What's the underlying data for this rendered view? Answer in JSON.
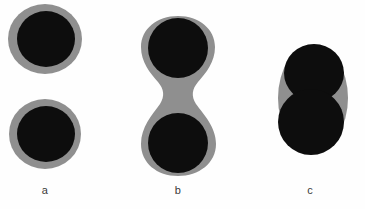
{
  "figure": {
    "name": "particle-coalescence-stages",
    "width": 365,
    "height": 209,
    "background_color": "#fefefe",
    "colors": {
      "core": "#0d0d0d",
      "shell": "#8f8f8f",
      "label_text": "#3a3a3a",
      "background": "#fefefe"
    }
  },
  "panels": [
    {
      "id": "a",
      "label": "a",
      "label_x": 45,
      "label_y": 190,
      "description": "two separate core-shell particles",
      "shells": [
        {
          "name": "shell-top",
          "cx": 45,
          "cy": 39,
          "rx": 37,
          "ry": 35
        },
        {
          "name": "shell-bottom",
          "cx": 45,
          "cy": 134,
          "rx": 36,
          "ry": 35
        }
      ],
      "cores": [
        {
          "name": "core-top",
          "cx": 46,
          "cy": 39,
          "rx": 29,
          "ry": 28
        },
        {
          "name": "core-bottom",
          "cx": 46,
          "cy": 134,
          "rx": 29,
          "ry": 28
        }
      ]
    },
    {
      "id": "b",
      "label": "b",
      "label_x": 178,
      "label_y": 190,
      "description": "two cores joined by a narrow shell bridge forming a dumbbell",
      "shell_path": "M 178 16 C 199 16 215 29 215 47 C 215 62 206 73 198 82 C 192 89 191 96 196 104 C 204 115 216 127 216 144 C 216 163 199 176 178 176 C 157 176 141 163 141 144 C 141 127 152 115 160 104 C 165 96 164 89 158 82 C 150 73 141 62 141 47 C 141 29 157 16 178 16 Z",
      "cores": [
        {
          "name": "core-top",
          "cx": 178,
          "cy": 48,
          "rx": 30,
          "ry": 30
        },
        {
          "name": "core-bottom",
          "cx": 178,
          "cy": 143,
          "rx": 30,
          "ry": 30
        }
      ]
    },
    {
      "id": "c",
      "label": "c",
      "label_x": 310,
      "label_y": 190,
      "description": "two cores in contact enclosed in a single shell envelope",
      "shells": [
        {
          "name": "shell-envelope",
          "cx": 313,
          "cy": 98,
          "rx": 35,
          "ry": 53
        }
      ],
      "cores": [
        {
          "name": "core-top",
          "cx": 314,
          "cy": 73,
          "rx": 30,
          "ry": 29
        },
        {
          "name": "core-bottom",
          "cx": 311,
          "cy": 122,
          "rx": 33,
          "ry": 33
        }
      ]
    }
  ]
}
